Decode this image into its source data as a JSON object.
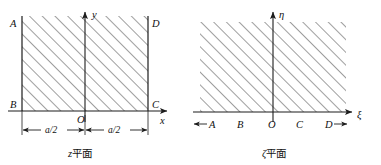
{
  "figure": {
    "kind": "conformal-mapping-diagram",
    "panels": [
      {
        "id": "z-plane",
        "caption_symbol": "z",
        "caption_text": "平面",
        "caption_full": "z平面",
        "vertical_axis_label": "y",
        "horizontal_axis_label": "x",
        "origin_label": "O",
        "corner_labels": {
          "top_left": "A",
          "bottom_left": "B",
          "bottom_right": "C",
          "top_right": "D"
        },
        "dimension_labels": [
          "a/2",
          "a/2"
        ],
        "region_description": "hatched semi-infinite strip",
        "hatch_angle_deg": 45
      },
      {
        "id": "zeta-plane",
        "caption_symbol": "ζ",
        "caption_text": "平面",
        "caption_full": "ζ平面",
        "vertical_axis_label": "η",
        "horizontal_axis_label": "ξ",
        "origin_label": "O",
        "axis_point_labels": [
          "A",
          "B",
          "O",
          "C",
          "D"
        ],
        "left_arrow_glyph": "←",
        "right_arrow_glyph": "→",
        "region_description": "hatched upper half-plane",
        "hatch_angle_deg": 45
      }
    ]
  },
  "colors": {
    "ink": "#1c1c1c",
    "hatch": "#2a2a2a",
    "background": "#ffffff"
  }
}
